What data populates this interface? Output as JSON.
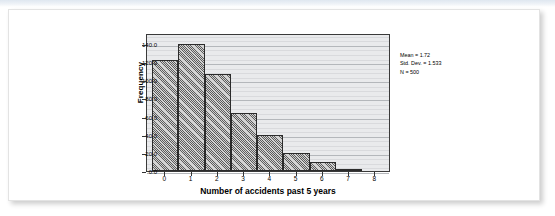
{
  "page": {
    "background_color": "#ffffff",
    "card_background": "#ffffff",
    "top_band_color": "#dfe7f0"
  },
  "figure": {
    "plot_background": "#e9eaec",
    "frame_color": "#3a3a3a",
    "bar_fill_color": "#9c9c9c",
    "bar_edge_color": "#2b2b2b",
    "gridline_color": "#c6c8cb"
  },
  "stats": {
    "mean_label": "Mean = 1.72",
    "std_dev_label": "Std. Dev. = 1.533",
    "n_label": "N = 500"
  },
  "chart_data": {
    "type": "bar",
    "title": "",
    "subtitle": "",
    "xlabel": "Number of accidents past 5 years",
    "ylabel": "Frequency",
    "categories": [
      "0",
      "1",
      "2",
      "3",
      "4",
      "5",
      "6",
      "7",
      "8"
    ],
    "values": [
      122,
      140,
      107,
      64,
      40,
      20,
      10,
      2,
      0
    ],
    "xlim": [
      -0.7,
      8.6
    ],
    "ylim": [
      0,
      152
    ],
    "x_tick_labels": [
      "0",
      "1",
      "2",
      "3",
      "4",
      "5",
      "6",
      "7",
      "8"
    ],
    "x_tick_values": [
      0,
      1,
      2,
      3,
      4,
      5,
      6,
      7,
      8
    ],
    "y_tick_labels": [
      "0.0",
      "20.0",
      "40.0",
      "60.0",
      "80.0",
      "100.0",
      "120.0",
      "140.0"
    ],
    "y_tick_values": [
      0,
      20,
      40,
      60,
      80,
      100,
      120,
      140
    ],
    "grid": true,
    "grid_orientation": "horizontal",
    "legend": false,
    "legend_position": "none",
    "bar_width": 1.0,
    "annotations": [
      "Mean = 1.72",
      "Std. Dev. = 1.533",
      "N = 500"
    ]
  }
}
